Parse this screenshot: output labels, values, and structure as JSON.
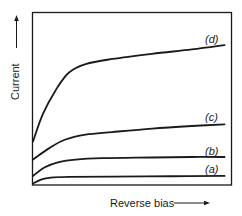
{
  "chart_data": {
    "type": "line",
    "title": "",
    "xlabel": "Reverse bias",
    "ylabel": "Current",
    "xlim": [
      0,
      100
    ],
    "ylim": [
      0,
      100
    ],
    "grid": false,
    "ticks": false,
    "legend_position": "inline-right",
    "axis_style": "boxed frame with arrows on axis labels",
    "series": [
      {
        "name": "(d)",
        "label_text": "(d)",
        "x": [
          0,
          5,
          11.5,
          18,
          26.5,
          40,
          60,
          80,
          96.5
        ],
        "y": [
          25,
          41,
          55,
          65,
          70,
          73,
          76,
          78.5,
          81
        ]
      },
      {
        "name": "(c)",
        "label_text": "(c)",
        "x": [
          0,
          8,
          16,
          26.5,
          40,
          60,
          80,
          96.5
        ],
        "y": [
          14.5,
          21,
          26,
          29,
          30.5,
          32.5,
          34,
          35
        ]
      },
      {
        "name": "(b)",
        "label_text": "(b)",
        "x": [
          0,
          6,
          13,
          21.5,
          35,
          60,
          80,
          96.5
        ],
        "y": [
          5,
          10,
          13,
          14.5,
          15.3,
          15.7,
          16,
          16
        ]
      },
      {
        "name": "(a)",
        "label_text": "(a)",
        "x": [
          0,
          4,
          9,
          18,
          40,
          70,
          96.5
        ],
        "y": [
          0.5,
          2.8,
          4,
          4.4,
          4.6,
          4.8,
          5
        ]
      }
    ]
  },
  "labels": {
    "x_axis": "Reverse bias",
    "y_axis": "Current",
    "d": "(d)",
    "c": "(c)",
    "b": "(b)",
    "a": "(a)"
  },
  "colors": {
    "line": "#1a1a1a",
    "background": "#ffffff"
  }
}
